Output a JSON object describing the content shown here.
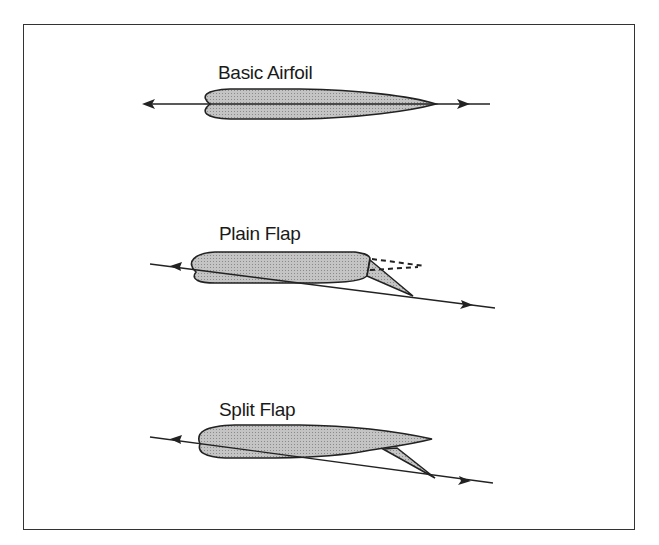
{
  "diagram": {
    "panels": [
      {
        "title": "Basic Airfoil",
        "type": "basic"
      },
      {
        "title": "Plain Flap",
        "type": "plain-flap"
      },
      {
        "title": "Split Flap",
        "type": "split-flap"
      }
    ],
    "colors": {
      "fill": "#b8b8b8",
      "stroke": "#222222",
      "frame": "#333333"
    }
  }
}
